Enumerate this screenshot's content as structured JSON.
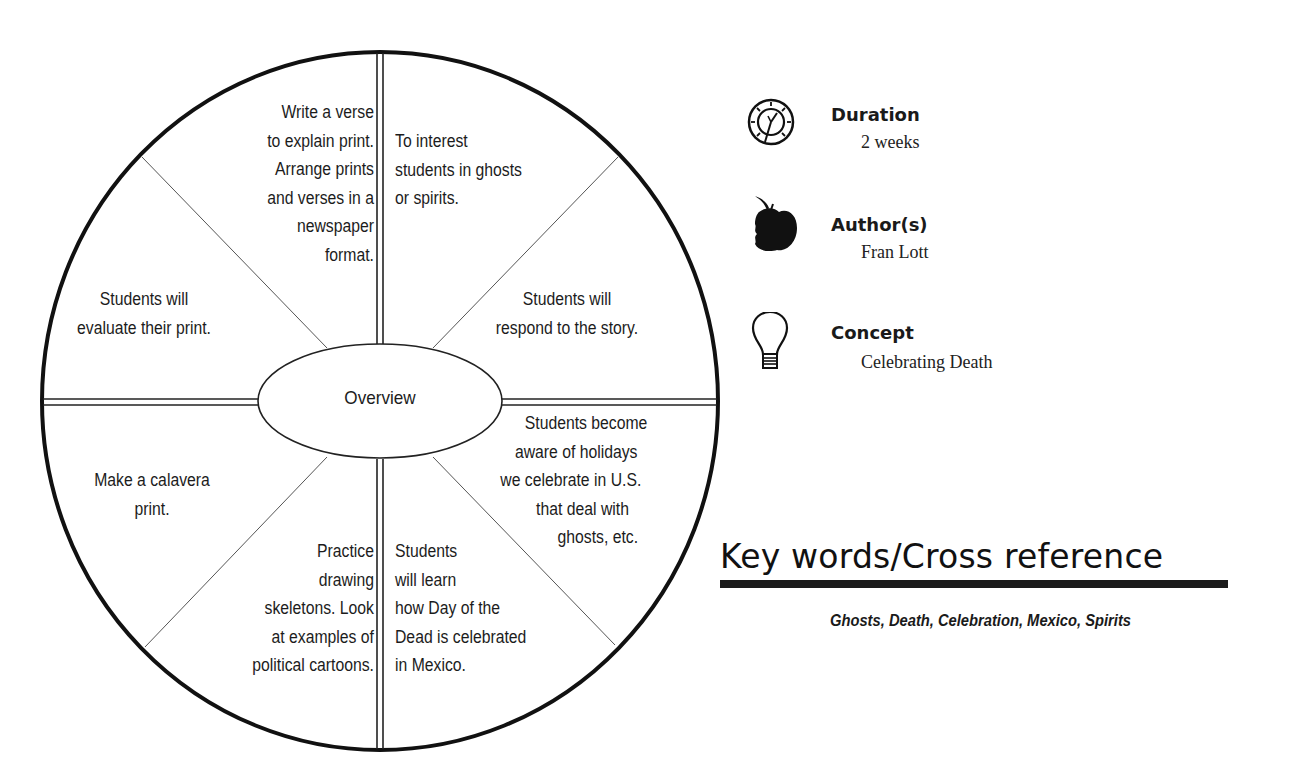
{
  "wheel": {
    "center": "Overview",
    "segments": {
      "top_left": [
        "Write a verse",
        "to explain print.",
        "Arrange prints",
        "and verses in a",
        "newspaper",
        "format."
      ],
      "top_right": [
        "To interest",
        "students in ghosts",
        "or spirits."
      ],
      "upper_left": [
        "Students will",
        "evaluate their print."
      ],
      "upper_right": [
        "Students will",
        "respond to the story."
      ],
      "lower_left": [
        "Make a calavera",
        "print."
      ],
      "lower_right": [
        "Students become",
        "aware of holidays",
        "we celebrate in U.S.",
        "that deal with",
        "ghosts, etc."
      ],
      "bottom_left": [
        "Practice",
        "drawing",
        "skeletons. Look",
        "at examples of",
        "political cartoons."
      ],
      "bottom_right": [
        "Students",
        "will learn",
        "how Day of the",
        "Dead is celebrated",
        "in Mexico."
      ]
    }
  },
  "info": {
    "duration": {
      "label": "Duration",
      "value": "2 weeks",
      "icon": "clock-icon"
    },
    "authors": {
      "label": "Author(s)",
      "value": "Fran Lott",
      "icon": "apple-icon"
    },
    "concept": {
      "label": "Concept",
      "value": "Celebrating Death",
      "icon": "lightbulb-icon"
    }
  },
  "keywords": {
    "title": "Key words/Cross reference",
    "list": "Ghosts, Death, Celebration, Mexico, Spirits"
  }
}
